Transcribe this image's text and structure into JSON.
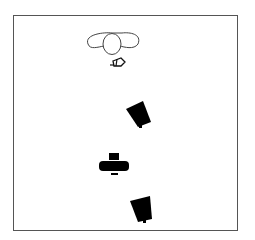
{
  "diagram": {
    "type": "lighting-setup-top-view",
    "colors": {
      "background": "#ffffff",
      "frame": "#555555",
      "outline": "#333333",
      "fill": "#000000"
    },
    "elements": [
      {
        "id": "subject",
        "label": "",
        "kind": "person-top-view"
      },
      {
        "id": "reflector",
        "label": "",
        "kind": "small-light"
      },
      {
        "id": "light-1",
        "label": "",
        "kind": "softbox"
      },
      {
        "id": "camera",
        "label": "",
        "kind": "camera"
      },
      {
        "id": "light-2",
        "label": "",
        "kind": "softbox"
      }
    ]
  }
}
